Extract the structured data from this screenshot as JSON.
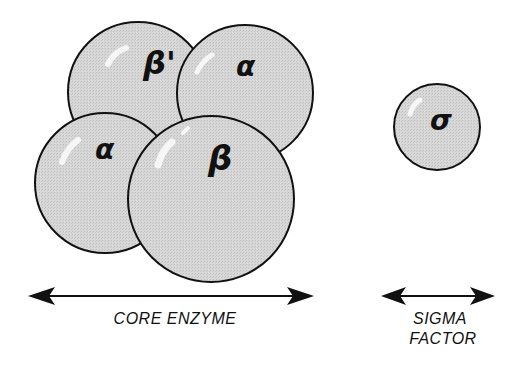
{
  "diagram": {
    "colors": {
      "subunit_fill": "#d6d6d6",
      "outline": "#111111",
      "highlight": "#f4f4f4",
      "background": "#ffffff"
    },
    "subunits": [
      {
        "id": "beta-prime",
        "label": "β'",
        "cx": 138,
        "cy": 92,
        "r": 70
      },
      {
        "id": "alpha-top",
        "label": "α",
        "cx": 245,
        "cy": 93,
        "r": 68
      },
      {
        "id": "alpha-bottom",
        "label": "α",
        "cx": 105,
        "cy": 183,
        "r": 70
      },
      {
        "id": "beta",
        "label": "β",
        "cx": 211,
        "cy": 199,
        "r": 83
      },
      {
        "id": "sigma",
        "label": "σ",
        "cx": 437,
        "cy": 127,
        "r": 43
      }
    ],
    "arrows": [
      {
        "id": "core-enzyme-arrow",
        "x1": 28,
        "x2": 314,
        "y": 296
      },
      {
        "id": "sigma-factor-arrow",
        "x1": 381,
        "x2": 495,
        "y": 296
      }
    ],
    "labels": {
      "core_enzyme": "CORE ENZYME",
      "sigma_line1": "SIGMA",
      "sigma_line2": "FACTOR"
    }
  }
}
